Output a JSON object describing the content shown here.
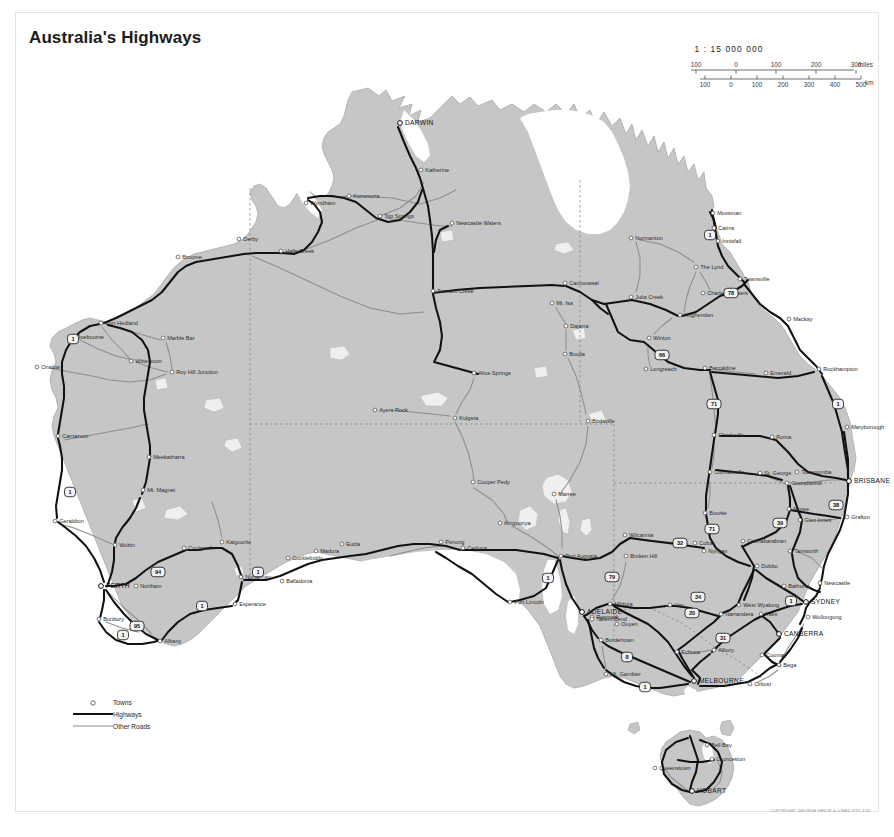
{
  "document": {
    "title": "Australia's Highways",
    "copyright": "COPYRIGHT. GEORGE PHILIP & O'NEIL PTY. LTD."
  },
  "scale": {
    "ratio": "1 : 15 000 000",
    "miles_ticks": [
      "100",
      "0",
      "100",
      "200",
      "300"
    ],
    "miles_unit": "miles",
    "km_ticks": [
      "100",
      "0",
      "100",
      "200",
      "300",
      "400",
      "500"
    ],
    "km_unit": "km"
  },
  "legend": {
    "items": [
      {
        "key": "towns",
        "label": "Towns",
        "symbol": "circle"
      },
      {
        "key": "highways",
        "label": "Highways",
        "symbol": "thick-line",
        "color": "#111111"
      },
      {
        "key": "other_roads",
        "label": "Other Roads",
        "symbol": "thin-line",
        "color": "#8d8d8d"
      }
    ]
  },
  "colors": {
    "land": "#c6c6c6",
    "land_edge": "#9a9a9a",
    "ocean": "#ffffff",
    "highway": "#111111",
    "other_road": "#8d8d8d",
    "border": "#7d7d7d",
    "text": "#2a2a2a"
  },
  "map": {
    "capitals": [
      {
        "name": "DARWIN",
        "x": 400,
        "y": 123
      },
      {
        "name": "BRISBANE",
        "x": 849,
        "y": 481
      },
      {
        "name": "PERTH",
        "x": 101,
        "y": 586
      },
      {
        "name": "ADELAIDE",
        "x": 582,
        "y": 612
      },
      {
        "name": "SYDNEY",
        "x": 806,
        "y": 602
      },
      {
        "name": "CANBERRA",
        "x": 779,
        "y": 634
      },
      {
        "name": "MELBOURNE",
        "x": 694,
        "y": 681
      },
      {
        "name": "HOBART",
        "x": 692,
        "y": 791
      }
    ],
    "towns": [
      {
        "name": "Katherine",
        "x": 421,
        "y": 170
      },
      {
        "name": "Wyndham",
        "x": 306,
        "y": 203
      },
      {
        "name": "Kununurra",
        "x": 349,
        "y": 196
      },
      {
        "name": "Top Springs",
        "x": 380,
        "y": 216
      },
      {
        "name": "Newcastle Waters",
        "x": 452,
        "y": 223
      },
      {
        "name": "Halls Creek",
        "x": 281,
        "y": 251
      },
      {
        "name": "Derby",
        "x": 239,
        "y": 239
      },
      {
        "name": "Broome",
        "x": 178,
        "y": 257
      },
      {
        "name": "Port Hedland",
        "x": 101,
        "y": 323
      },
      {
        "name": "Roebourne",
        "x": 72,
        "y": 337
      },
      {
        "name": "Onslow",
        "x": 37,
        "y": 367
      },
      {
        "name": "Marble Bar",
        "x": 163,
        "y": 338
      },
      {
        "name": "Wittenoom",
        "x": 131,
        "y": 361
      },
      {
        "name": "Roy Hill Junction",
        "x": 172,
        "y": 372
      },
      {
        "name": "Carnarvon",
        "x": 58,
        "y": 436
      },
      {
        "name": "Meekatharra",
        "x": 149,
        "y": 457
      },
      {
        "name": "Mt. Magnet",
        "x": 143,
        "y": 490
      },
      {
        "name": "Geraldton",
        "x": 55,
        "y": 521
      },
      {
        "name": "Wubin",
        "x": 115,
        "y": 545
      },
      {
        "name": "Coolgardie",
        "x": 184,
        "y": 548
      },
      {
        "name": "Kalgoorlie",
        "x": 222,
        "y": 542
      },
      {
        "name": "Northam",
        "x": 136,
        "y": 586
      },
      {
        "name": "Norseman",
        "x": 241,
        "y": 577
      },
      {
        "name": "Balladonia",
        "x": 282,
        "y": 581
      },
      {
        "name": "Cocklebiddy",
        "x": 288,
        "y": 558
      },
      {
        "name": "Madura",
        "x": 316,
        "y": 551
      },
      {
        "name": "Eucla",
        "x": 342,
        "y": 544
      },
      {
        "name": "Penong",
        "x": 441,
        "y": 542
      },
      {
        "name": "Ceduna",
        "x": 463,
        "y": 548
      },
      {
        "name": "Bunbury",
        "x": 99,
        "y": 619
      },
      {
        "name": "Esperance",
        "x": 235,
        "y": 604
      },
      {
        "name": "Albany",
        "x": 160,
        "y": 641
      },
      {
        "name": "Tennant Creek",
        "x": 433,
        "y": 291
      },
      {
        "name": "Alice Springs",
        "x": 474,
        "y": 373
      },
      {
        "name": "Ayers Rock",
        "x": 375,
        "y": 410
      },
      {
        "name": "Kulgera",
        "x": 455,
        "y": 418
      },
      {
        "name": "Camooweal",
        "x": 565,
        "y": 283
      },
      {
        "name": "Mt. Isa",
        "x": 552,
        "y": 303
      },
      {
        "name": "Dajarra",
        "x": 566,
        "y": 326
      },
      {
        "name": "Boulia",
        "x": 565,
        "y": 354
      },
      {
        "name": "Birdsville",
        "x": 588,
        "y": 421
      },
      {
        "name": "Normanton",
        "x": 631,
        "y": 238
      },
      {
        "name": "Mossman",
        "x": 713,
        "y": 213
      },
      {
        "name": "Cairns",
        "x": 714,
        "y": 228
      },
      {
        "name": "Innisfail",
        "x": 718,
        "y": 241
      },
      {
        "name": "The Lynd",
        "x": 696,
        "y": 267
      },
      {
        "name": "Townsville",
        "x": 740,
        "y": 279
      },
      {
        "name": "Charters Towers",
        "x": 703,
        "y": 293
      },
      {
        "name": "Julia Creek",
        "x": 631,
        "y": 297
      },
      {
        "name": "Hughenden",
        "x": 680,
        "y": 315
      },
      {
        "name": "Winton",
        "x": 649,
        "y": 338
      },
      {
        "name": "Longreach",
        "x": 646,
        "y": 369
      },
      {
        "name": "Barcaldine",
        "x": 705,
        "y": 368
      },
      {
        "name": "Emerald",
        "x": 766,
        "y": 373
      },
      {
        "name": "Mackay",
        "x": 789,
        "y": 319
      },
      {
        "name": "Rockhampton",
        "x": 819,
        "y": 369
      },
      {
        "name": "Maryborough",
        "x": 847,
        "y": 427
      },
      {
        "name": "Charleville",
        "x": 714,
        "y": 435
      },
      {
        "name": "Roma",
        "x": 772,
        "y": 437
      },
      {
        "name": "Cunnamulla",
        "x": 710,
        "y": 472
      },
      {
        "name": "St. George",
        "x": 760,
        "y": 473
      },
      {
        "name": "Toowoomba",
        "x": 797,
        "y": 472
      },
      {
        "name": "Goondiwindi",
        "x": 787,
        "y": 483
      },
      {
        "name": "Moree",
        "x": 789,
        "y": 509
      },
      {
        "name": "Glen Innes",
        "x": 800,
        "y": 520
      },
      {
        "name": "Grafton",
        "x": 847,
        "y": 517
      },
      {
        "name": "Bourke",
        "x": 705,
        "y": 513
      },
      {
        "name": "Cobar",
        "x": 695,
        "y": 543
      },
      {
        "name": "Coonabarabran",
        "x": 743,
        "y": 541
      },
      {
        "name": "Nyngan",
        "x": 704,
        "y": 551
      },
      {
        "name": "Tamworth",
        "x": 790,
        "y": 551
      },
      {
        "name": "Dubbo",
        "x": 757,
        "y": 566
      },
      {
        "name": "Bathurst",
        "x": 784,
        "y": 586
      },
      {
        "name": "Newcastle",
        "x": 820,
        "y": 583
      },
      {
        "name": "Wollongong",
        "x": 808,
        "y": 617
      },
      {
        "name": "Wilcannia",
        "x": 625,
        "y": 535
      },
      {
        "name": "Broken Hill",
        "x": 626,
        "y": 556
      },
      {
        "name": "Port Augusta",
        "x": 561,
        "y": 556
      },
      {
        "name": "Port Lincoln",
        "x": 510,
        "y": 602
      },
      {
        "name": "Kingoonya",
        "x": 500,
        "y": 523
      },
      {
        "name": "Marree",
        "x": 554,
        "y": 494
      },
      {
        "name": "Cooper Pedy",
        "x": 473,
        "y": 482
      },
      {
        "name": "Mildura",
        "x": 610,
        "y": 604
      },
      {
        "name": "Renmark",
        "x": 592,
        "y": 617
      },
      {
        "name": "Ouyen",
        "x": 617,
        "y": 624
      },
      {
        "name": "Bordertown",
        "x": 601,
        "y": 640
      },
      {
        "name": "Mt. Gambier",
        "x": 606,
        "y": 674
      },
      {
        "name": "Echuca",
        "x": 677,
        "y": 652
      },
      {
        "name": "Hay",
        "x": 670,
        "y": 605
      },
      {
        "name": "West Wyalong",
        "x": 739,
        "y": 605
      },
      {
        "name": "Narrandera",
        "x": 721,
        "y": 614
      },
      {
        "name": "Yass",
        "x": 761,
        "y": 614
      },
      {
        "name": "Albury",
        "x": 714,
        "y": 650
      },
      {
        "name": "Cooma",
        "x": 762,
        "y": 655
      },
      {
        "name": "Bega",
        "x": 779,
        "y": 665
      },
      {
        "name": "Orbost",
        "x": 750,
        "y": 684
      },
      {
        "name": "Tailem Bend",
        "x": 592,
        "y": 619
      },
      {
        "name": "Queenstown",
        "x": 655,
        "y": 768
      },
      {
        "name": "Launceston",
        "x": 712,
        "y": 759
      },
      {
        "name": "Bell Bay",
        "x": 707,
        "y": 745
      }
    ],
    "route_shields": [
      {
        "number": "1",
        "x": 710,
        "y": 235
      },
      {
        "number": "78",
        "x": 731,
        "y": 293
      },
      {
        "number": "66",
        "x": 662,
        "y": 355
      },
      {
        "number": "71",
        "x": 714,
        "y": 404
      },
      {
        "number": "1",
        "x": 838,
        "y": 404
      },
      {
        "number": "39",
        "x": 780,
        "y": 523
      },
      {
        "number": "38",
        "x": 836,
        "y": 505
      },
      {
        "number": "71",
        "x": 712,
        "y": 529
      },
      {
        "number": "32",
        "x": 680,
        "y": 543
      },
      {
        "number": "79",
        "x": 612,
        "y": 577
      },
      {
        "number": "1",
        "x": 548,
        "y": 578
      },
      {
        "number": "34",
        "x": 698,
        "y": 597
      },
      {
        "number": "20",
        "x": 692,
        "y": 613
      },
      {
        "number": "31",
        "x": 723,
        "y": 638
      },
      {
        "number": "1",
        "x": 791,
        "y": 601
      },
      {
        "number": "8",
        "x": 627,
        "y": 657
      },
      {
        "number": "1",
        "x": 645,
        "y": 687
      },
      {
        "number": "94",
        "x": 158,
        "y": 572
      },
      {
        "number": "1",
        "x": 258,
        "y": 572
      },
      {
        "number": "1",
        "x": 202,
        "y": 606
      },
      {
        "number": "95",
        "x": 137,
        "y": 626
      },
      {
        "number": "1",
        "x": 123,
        "y": 635
      },
      {
        "number": "1",
        "x": 70,
        "y": 492
      },
      {
        "number": "1",
        "x": 73,
        "y": 339
      }
    ]
  }
}
